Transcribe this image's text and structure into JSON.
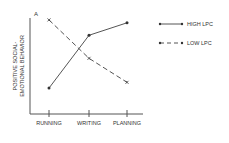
{
  "chart_data": {
    "type": "line",
    "title": "",
    "panel_label": "A",
    "xlabel": "",
    "ylabel": "POSITIVE SOCIAL-EMOTIONAL BEHAVIOR",
    "ylabel_lines": [
      "POSITIVE SOCIAL-",
      "EMOTIONAL BEHAVIOR"
    ],
    "categories": [
      "RUNNING",
      "WRITING",
      "PLANNING"
    ],
    "ylim": [
      0,
      10
    ],
    "grid": false,
    "legend_position": "right",
    "series": [
      {
        "name": "HIGH LPC",
        "style": "solid",
        "marker": "dot",
        "values": [
          2.7,
          8.2,
          9.5
        ]
      },
      {
        "name": "LOW LPC",
        "style": "dashed",
        "marker": "x",
        "values": [
          9.8,
          5.8,
          3.3
        ]
      }
    ]
  },
  "colors": {
    "line": "#555555",
    "text": "#333333"
  }
}
